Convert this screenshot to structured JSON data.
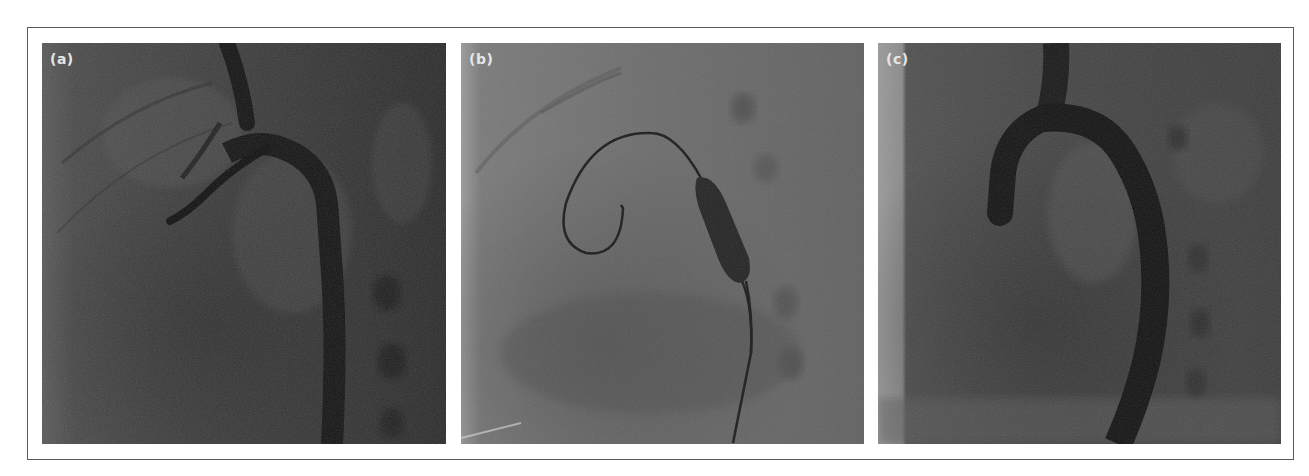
{
  "figure": {
    "border_color": "#5a5a5a",
    "panels": [
      {
        "label": "(a)",
        "description": "Aortic angiogram showing aortic arch and descending aorta with catheter",
        "tone": "dark"
      },
      {
        "label": "(b)",
        "description": "Guidewire looped in ventricle with inflated balloon in aortic isthmus",
        "tone": "light"
      },
      {
        "label": "(c)",
        "description": "Post-dilation angiogram showing aortic arch and descending aorta",
        "tone": "medium"
      }
    ]
  },
  "colors": {
    "label_text": "#e6e6e6",
    "panel_a_base": "#3e3e3e",
    "panel_b_base": "#6e6e6e",
    "panel_c_base": "#4a4a4a",
    "vessel_dark": "#141414"
  }
}
